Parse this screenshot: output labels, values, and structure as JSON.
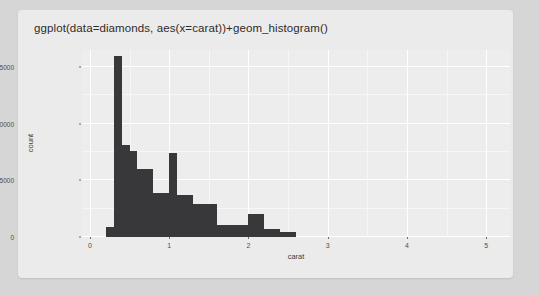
{
  "card": {
    "code_title": "ggplot(data=diamonds, aes(x=carat))+geom_histogram()"
  },
  "colors": {
    "page_background": "#d6d6d6",
    "card_background": "#ebebeb",
    "panel_background": "#ededed",
    "bar_fill": "#38383a",
    "gridline_major": "#ffffff",
    "axis_text": "#4d4d4d"
  },
  "chart_data": {
    "type": "bar",
    "title": "",
    "xlabel": "carat",
    "ylabel": "count",
    "xlim": [
      -0.1,
      5.3
    ],
    "ylim": [
      0,
      16500
    ],
    "grid": true,
    "legend": "none",
    "xticks": [
      0,
      1,
      2,
      3,
      4,
      5
    ],
    "xtick_labels": [
      "0",
      "1",
      "2",
      "3",
      "4",
      "5"
    ],
    "yticks": [
      0,
      5000,
      10000,
      15000
    ],
    "ytick_labels": [
      "0",
      "5000",
      "10000",
      "15000"
    ],
    "bin_width": 0.1,
    "bins": [
      {
        "x0": 0.2,
        "x1": 0.3,
        "count": 900
      },
      {
        "x0": 0.3,
        "x1": 0.4,
        "count": 16000
      },
      {
        "x0": 0.4,
        "x1": 0.5,
        "count": 8100
      },
      {
        "x0": 0.5,
        "x1": 0.6,
        "count": 7600
      },
      {
        "x0": 0.6,
        "x1": 0.7,
        "count": 6000
      },
      {
        "x0": 0.7,
        "x1": 0.8,
        "count": 6000
      },
      {
        "x0": 0.8,
        "x1": 0.9,
        "count": 3900
      },
      {
        "x0": 0.9,
        "x1": 1.0,
        "count": 3900
      },
      {
        "x0": 1.0,
        "x1": 1.1,
        "count": 7400
      },
      {
        "x0": 1.1,
        "x1": 1.2,
        "count": 3700
      },
      {
        "x0": 1.2,
        "x1": 1.3,
        "count": 3700
      },
      {
        "x0": 1.3,
        "x1": 1.5,
        "count": 2900
      },
      {
        "x0": 1.5,
        "x1": 1.6,
        "count": 2900
      },
      {
        "x0": 1.6,
        "x1": 1.8,
        "count": 1100
      },
      {
        "x0": 1.8,
        "x1": 2.0,
        "count": 1100
      },
      {
        "x0": 2.0,
        "x1": 2.2,
        "count": 2000
      },
      {
        "x0": 2.2,
        "x1": 2.4,
        "count": 700
      },
      {
        "x0": 2.4,
        "x1": 2.6,
        "count": 400
      }
    ]
  }
}
